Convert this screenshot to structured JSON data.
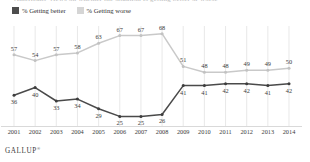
{
  "title_clipped": "Americans' views on whether the situation is getting better or worse",
  "legend": {
    "items": [
      {
        "label": "% Getting better",
        "color": "#4d4d4d",
        "swatch": "better"
      },
      {
        "label": "% Getting worse",
        "color": "#d5d5d5",
        "swatch": "worse"
      }
    ]
  },
  "footer": {
    "brand": "GALLUP",
    "mark": "®"
  },
  "chart_data": {
    "type": "line",
    "title": "",
    "xlabel": "",
    "ylabel": "",
    "grid": "vertical",
    "legend_position": "top-left",
    "ylim": [
      20,
      72
    ],
    "categories": [
      "2001",
      "2002",
      "2003",
      "2004",
      "2005",
      "2006",
      "2007",
      "2008",
      "2009",
      "2010",
      "2011",
      "2012",
      "2013",
      "2014"
    ],
    "series": [
      {
        "name": "% Getting worse",
        "color": "#c9c9c9",
        "marker_color": "#c2c2c2",
        "values": [
          57,
          54,
          57,
          58,
          63,
          67,
          67,
          68,
          51,
          48,
          48,
          49,
          49,
          50
        ]
      },
      {
        "name": "% Getting better",
        "color": "#4a4a4a",
        "marker_color": "#3d3d3d",
        "values": [
          36,
          40,
          33,
          34,
          29,
          25,
          25,
          26,
          41,
          41,
          42,
          42,
          41,
          42
        ]
      }
    ]
  }
}
